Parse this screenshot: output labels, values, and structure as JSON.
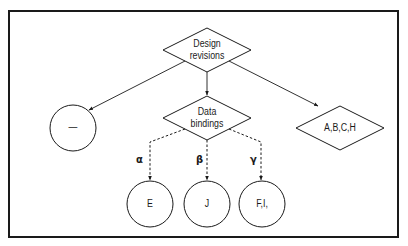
{
  "diagram": {
    "root": {
      "line1": "Design",
      "line2": "revisions"
    },
    "left_node": {
      "label": "—"
    },
    "middle_node": {
      "line1": "Data",
      "line2": "bindings"
    },
    "right_node": {
      "label": "A,B,C,H"
    },
    "edges": {
      "alpha": "α",
      "beta": "β",
      "gamma": "γ"
    },
    "leaves": [
      {
        "label": "E"
      },
      {
        "label": "J"
      },
      {
        "label": "F,I,"
      }
    ]
  }
}
